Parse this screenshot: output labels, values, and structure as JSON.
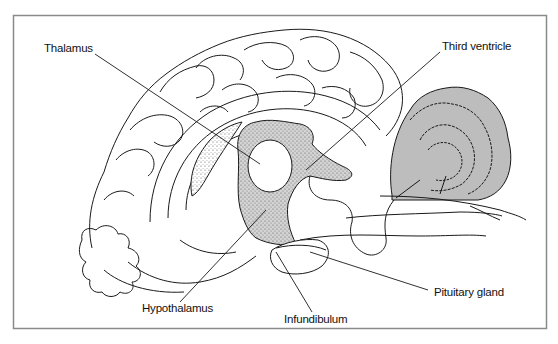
{
  "figure": {
    "colors": {
      "outline": "#1a1a1a",
      "shaded_region": "#c9c9c9",
      "cerebellum_fill": "#b8b8b8",
      "frame": "#8a8a8a",
      "background": "#ffffff"
    },
    "labels": [
      {
        "id": "thalamus",
        "text": "Thalamus"
      },
      {
        "id": "third-ventricle",
        "text": "Third ventricle"
      },
      {
        "id": "hypothalamus",
        "text": "Hypothalamus"
      },
      {
        "id": "infundibulum",
        "text": "Infundibulum"
      },
      {
        "id": "pituitary-gland",
        "text": "Pituitary gland"
      }
    ]
  }
}
